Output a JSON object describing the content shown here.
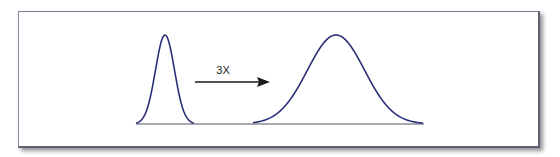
{
  "diagram": {
    "type": "distribution-broadening",
    "arrow_label": "3X",
    "colors": {
      "curve": "#2b2f7a",
      "baseline": "#8a8c94",
      "arrow": "#1a1a1a"
    },
    "curves": [
      {
        "name": "narrow-distribution",
        "relative_width": 1
      },
      {
        "name": "wide-distribution",
        "relative_width": 3
      }
    ]
  }
}
